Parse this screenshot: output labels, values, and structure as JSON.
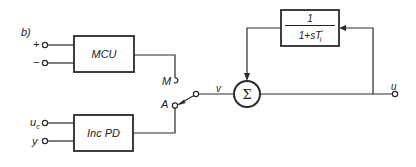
{
  "figure_label": "b)",
  "blocks": {
    "mcu": {
      "label": "MCU",
      "inputs": [
        "+",
        "−"
      ]
    },
    "inc_pd": {
      "label": "Inc PD",
      "inputs": [
        "u",
        "y"
      ],
      "input_subscripts": [
        "c",
        ""
      ]
    },
    "feedback": {
      "numerator": "1",
      "denominator": "1+sT",
      "denominator_subscript": "i",
      "denominator_prime": "′"
    }
  },
  "switch": {
    "position_m_label": "M",
    "position_a_label": "A",
    "selected": "A"
  },
  "summing_junction": {
    "symbol": "Σ"
  },
  "signals": {
    "v": "v",
    "u": "u"
  },
  "colors": {
    "line": "#2a2a2a",
    "background": "#ffffff"
  }
}
